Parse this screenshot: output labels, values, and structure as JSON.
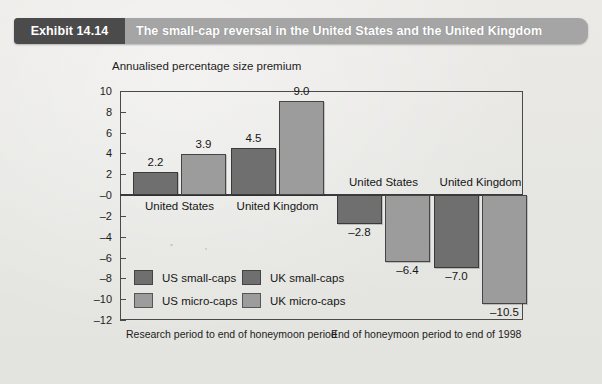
{
  "header": {
    "exhibit_tag": "Exhibit 14.14",
    "title": "The small-cap reversal in the United States and the United Kingdom"
  },
  "chart_data": {
    "type": "bar",
    "title": "The small-cap reversal in the United States and the United Kingdom",
    "subtitle": "",
    "ylabel": "Annualised percentage size premium",
    "xlabel": "",
    "ylim": [
      -12,
      10
    ],
    "yticks": [
      "10",
      "8",
      "6",
      "4",
      "2",
      "–0",
      "–2",
      "–4",
      "–6",
      "–8",
      "–10",
      "–12"
    ],
    "ytick_values": [
      10,
      8,
      6,
      4,
      2,
      0,
      -2,
      -4,
      -6,
      -8,
      -10,
      -12
    ],
    "grid": false,
    "legend_position": "inside-lower-left",
    "legend": [
      "US small-caps",
      "US micro-caps",
      "UK small-caps",
      "UK micro-caps"
    ],
    "panels": [
      {
        "label": "Research period to end of honeymoon period"
      },
      {
        "label": "End of honeymoon period to end of 1998"
      }
    ],
    "groups": [
      {
        "country": "United States",
        "panel": 0,
        "bars": [
          {
            "series": "US small-caps",
            "value": 2.2,
            "label": "2.2",
            "style": "small"
          },
          {
            "series": "US micro-caps",
            "value": 3.9,
            "label": "3.9",
            "style": "micro"
          }
        ]
      },
      {
        "country": "United Kingdom",
        "panel": 0,
        "bars": [
          {
            "series": "UK small-caps",
            "value": 4.5,
            "label": "4.5",
            "style": "small"
          },
          {
            "series": "UK micro-caps",
            "value": 9.0,
            "label": "9.0",
            "style": "micro"
          }
        ]
      },
      {
        "country": "United States",
        "panel": 1,
        "bars": [
          {
            "series": "US small-caps",
            "value": -2.8,
            "label": "–2.8",
            "style": "small"
          },
          {
            "series": "US micro-caps",
            "value": -6.4,
            "label": "–6.4",
            "style": "micro"
          }
        ]
      },
      {
        "country": "United Kingdom",
        "panel": 1,
        "bars": [
          {
            "series": "UK small-caps",
            "value": -7.0,
            "label": "–7.0",
            "style": "small"
          },
          {
            "series": "UK micro-caps",
            "value": -10.5,
            "label": "–10.5",
            "style": "micro"
          }
        ]
      }
    ],
    "colors": {
      "small_caps": "#6f6f6f",
      "micro_caps": "#9c9c9c",
      "header_tag": "#4b4b4b",
      "header_bar": "#a5a5a5",
      "page_background": "#e9e9e6",
      "axis": "#4a4a4a"
    }
  },
  "ticks": [
    {
      "label": "10",
      "v": 10
    },
    {
      "label": "8",
      "v": 8
    },
    {
      "label": "6",
      "v": 6
    },
    {
      "label": "4",
      "v": 4
    },
    {
      "label": "2",
      "v": 2
    },
    {
      "label": "–0",
      "v": 0
    },
    {
      "label": "–2",
      "v": -2
    },
    {
      "label": "–4",
      "v": -4
    },
    {
      "label": "–6",
      "v": -6
    },
    {
      "label": "–8",
      "v": -8
    },
    {
      "label": "–10",
      "v": -10
    },
    {
      "label": "–12",
      "v": -12
    }
  ],
  "axis_title": "Annualised percentage size premium",
  "group_labels": [
    "United States",
    "United Kingdom",
    "United States",
    "United Kingdom"
  ],
  "bar_labels": [
    "2.2",
    "3.9",
    "4.5",
    "9.0",
    "–2.8",
    "–6.4",
    "–7.0",
    "–10.5"
  ],
  "legend": {
    "items": [
      {
        "label": "US small-caps",
        "style": "small"
      },
      {
        "label": "US micro-caps",
        "style": "micro"
      },
      {
        "label": "UK small-caps",
        "style": "small"
      },
      {
        "label": "UK micro-caps",
        "style": "micro"
      }
    ]
  },
  "periods": {
    "left": "Research period to end of honeymoon period",
    "right": "End of honeymoon period to end of 1998"
  }
}
